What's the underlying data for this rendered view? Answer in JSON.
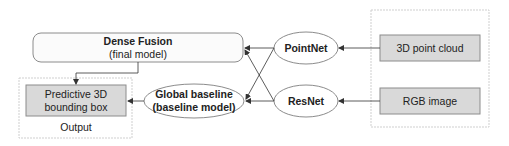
{
  "nodes": {
    "dense_fusion": {
      "title": "Dense Fusion",
      "subtitle": "(final model)"
    },
    "predictive_box": {
      "line1": "Predictive 3D",
      "line2": "bounding box"
    },
    "output_group": {
      "label": "Output"
    },
    "global_baseline": {
      "line1": "Global baseline",
      "line2": "(baseline model)"
    },
    "pointnet": {
      "label": "PointNet"
    },
    "resnet": {
      "label": "ResNet"
    },
    "point_cloud": {
      "label": "3D point cloud"
    },
    "rgb_image": {
      "label": "RGB image"
    }
  },
  "edges": [
    {
      "from": "3D point cloud",
      "to": "PointNet"
    },
    {
      "from": "RGB image",
      "to": "ResNet"
    },
    {
      "from": "PointNet",
      "to": "Dense Fusion"
    },
    {
      "from": "PointNet",
      "to": "Global baseline"
    },
    {
      "from": "ResNet",
      "to": "Dense Fusion"
    },
    {
      "from": "ResNet",
      "to": "Global baseline"
    },
    {
      "from": "Dense Fusion",
      "to": "Predictive 3D bounding box"
    },
    {
      "from": "Global baseline",
      "to": "Predictive 3D bounding box"
    }
  ],
  "colors": {
    "box_fill": "#d9d9d9",
    "box_stroke": "#8c8c8c",
    "group_stroke": "#cfcfcf",
    "rounded_fill": "#fbfbfb",
    "line": "#333333"
  }
}
